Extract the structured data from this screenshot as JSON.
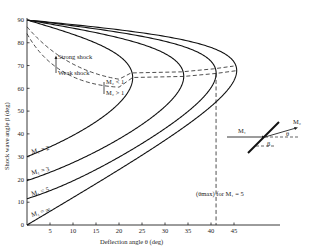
{
  "chart_data": {
    "type": "line",
    "title": "",
    "xlabel": "Deflection angle θ (deg)",
    "ylabel": "Shock wave angle β (deg)",
    "xlim": [
      0,
      55
    ],
    "ylim": [
      0,
      90
    ],
    "x_ticks": [
      5,
      10,
      15,
      20,
      25,
      30,
      35,
      40,
      45
    ],
    "y_ticks": [
      0,
      10,
      20,
      30,
      40,
      50,
      60,
      70,
      80,
      90
    ],
    "grid": false,
    "series": [
      {
        "name": "M₁ = 2",
        "mach": 2,
        "theta_max": 23.0,
        "beta_at_theta_max": 64.7,
        "beta_at_zero_deflection": 30.0
      },
      {
        "name": "M₁ = 3",
        "mach": 3,
        "theta_max": 34.1,
        "beta_at_theta_max": 65.8,
        "beta_at_zero_deflection": 19.5
      },
      {
        "name": "M₁ = 5",
        "mach": 5,
        "theta_max": 41.1,
        "beta_at_theta_max": 67.9,
        "beta_at_zero_deflection": 11.5
      },
      {
        "name": "M₁ = ∞",
        "mach": "infinity",
        "theta_max": 45.6,
        "beta_at_theta_max": 67.8,
        "beta_at_zero_deflection": 0
      }
    ],
    "annotations": {
      "strong_shock": "Strong shock",
      "weak_shock": "Weak shock",
      "m2_lt_1": "M₂ < 1",
      "m2_gt_1": "M₂ > 1",
      "theta_max_note": "(θmax) for M₁ = 5",
      "theta_max_value_M5": 41.1,
      "inset": {
        "m1": "M₁",
        "m2": "M₂",
        "theta": "θ",
        "beta": "β"
      },
      "label_M2": "M₁ = 2",
      "label_M3": "M₁ = 3",
      "label_M5": "M₁ = 5",
      "label_Minf": "M₁ = ∞"
    }
  }
}
